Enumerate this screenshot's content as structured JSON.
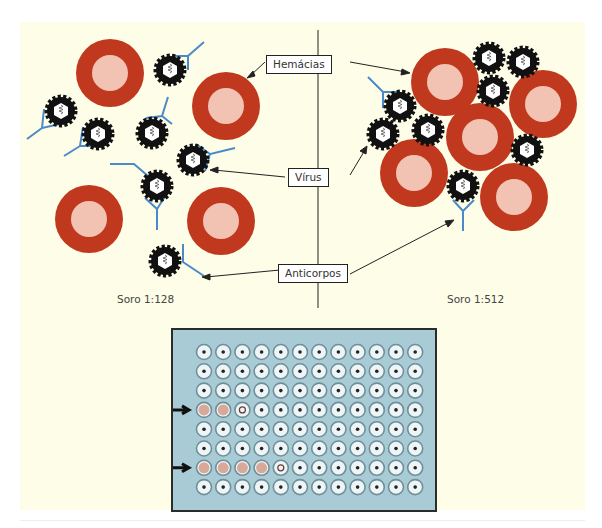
{
  "labels": {
    "hemacias": "Hemácias",
    "virus": "Vírus",
    "anticorpos": "Anticorpos"
  },
  "captions": {
    "left": "Soro 1:128",
    "right": "Soro 1:512"
  },
  "colors": {
    "background": "#fefde7",
    "rbc_outer": "#c0391e",
    "rbc_inner": "#f2c3b3",
    "antibody": "#4a8ac9",
    "virus": "#111111",
    "plate": "#a9cbd6"
  },
  "plate": {
    "rows": 8,
    "cols": 12,
    "marked_rows": [
      4,
      7
    ],
    "agglutinated_wells": {
      "4": 3,
      "7": 5
    }
  }
}
